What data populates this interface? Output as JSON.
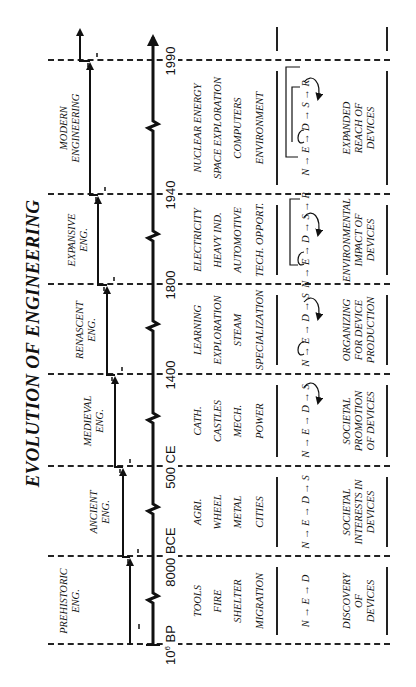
{
  "title": "EVOLUTION OF ENGINEERING",
  "timeline": {
    "dates": [
      {
        "label": "10",
        "sup": "6",
        "suffix": " BP"
      },
      {
        "label": "8000 BCE"
      },
      {
        "label": "500 CE"
      },
      {
        "label": "1400"
      },
      {
        "label": "1800"
      },
      {
        "label": "1940"
      },
      {
        "label": "1990"
      }
    ]
  },
  "eras": [
    {
      "name_lines": [
        "PREHISTORIC",
        "ENG."
      ],
      "topics": [
        "TOOLS",
        "FIRE",
        "SHELTER",
        "MIGRATION"
      ],
      "diagram": "N → E → D",
      "description_lines": [
        "DISCOVERY",
        "OF",
        "DEVICES"
      ]
    },
    {
      "name_lines": [
        "ANCIENT",
        "ENG."
      ],
      "topics": [
        "AGRI.",
        "WHEEL",
        "METAL",
        "CITIES"
      ],
      "diagram": "N → E → D → S",
      "description_lines": [
        "SOCIETAL",
        "INTERESTS IN",
        "DEVICES"
      ]
    },
    {
      "name_lines": [
        "MEDIEVAL",
        "ENG."
      ],
      "topics": [
        "CATH.",
        "CASTLES",
        "MECH.",
        "POWER"
      ],
      "diagram": "N → E → D → S",
      "description_lines": [
        "SOCIETAL",
        "PROMOTION",
        "OF DEVICES"
      ]
    },
    {
      "name_lines": [
        "RENASCENT",
        "ENG."
      ],
      "topics": [
        "LEARNING",
        "EXPLORATION",
        "STEAM",
        "SPECIALIZATION"
      ],
      "diagram": "N → E → D → S",
      "description_lines": [
        "ORGANIZING",
        "FOR DEVICE",
        "PRODUCTION"
      ]
    },
    {
      "name_lines": [
        "EXPANSIVE",
        "ENG."
      ],
      "topics": [
        "ELECTRICITY",
        "HEAVY IND.",
        "AUTOMOTIVE",
        "TECH. OPPORT."
      ],
      "diagram": "N → E → D → S → R",
      "description_lines": [
        "ENVIRONMENTAL",
        "IMPACT OF",
        "DEVICES"
      ]
    },
    {
      "name_lines": [
        "MODERN",
        "ENGINEERING"
      ],
      "topics": [
        "NUCLEAR ENERGY",
        "SPACE EXPLORATION",
        "COMPUTERS",
        "ENVIRONMENT"
      ],
      "diagram": "N → E → D → S → R",
      "description_lines": [
        "EXPANDED",
        "REACH OF",
        "DEVICES"
      ]
    }
  ]
}
